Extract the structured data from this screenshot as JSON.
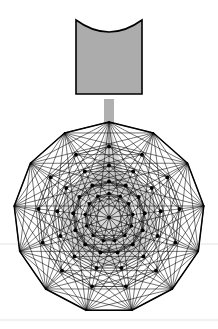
{
  "figure": {
    "background_color": "#ffffff",
    "canvas": {
      "width": 218,
      "height": 329
    }
  },
  "colors": {
    "stroke": "#000000",
    "gray_fill": "#ACACAC",
    "gray_stem": "#B0B0B0",
    "cone_shade": "#B4B4B4",
    "vertex_dot": "#000000",
    "faint_rule": "#EDEDED"
  },
  "cup": {
    "name": "gray cup shape",
    "left": 76,
    "right": 142,
    "top": 20,
    "bottom": 94,
    "concave_top_depth": 12,
    "fill": "#ACACAC",
    "stroke_width": 1.6
  },
  "stem": {
    "name": "connector stem",
    "left": 104,
    "right": 114,
    "top": 99,
    "bottom": 124,
    "fill": "#B0B0B0"
  },
  "cone": {
    "name": "gray cone shading",
    "apex_x": 109,
    "apex_y": 122,
    "base_y": 252,
    "half_width": 36,
    "fill": "#B4B4B4",
    "opacity": 0.55
  },
  "inner_ring_shade": {
    "name": "gray annulus shading",
    "center_x": 109,
    "center_y": 218,
    "outer_radius": 48,
    "inner_radius": 30,
    "fill": "#B4B4B4",
    "opacity": 0.5
  },
  "polygon": {
    "name": "tridecagon",
    "sides": 13,
    "center_x": 109,
    "center_y": 217.5,
    "radius": 95.5,
    "start_angle_deg": -90,
    "stroke_width": 1.5
  },
  "rings": [
    {
      "label": "outer",
      "radius": 95.5,
      "count": 13,
      "dot_radius": 0
    },
    {
      "label": "ring-2",
      "radius": 71.0,
      "count": 13,
      "dot_radius": 2.0
    },
    {
      "label": "ring-3",
      "radius": 52.0,
      "count": 13,
      "dot_radius": 2.0
    },
    {
      "label": "ring-4",
      "radius": 36.0,
      "count": 13,
      "dot_radius": 2.0
    },
    {
      "label": "ring-5",
      "radius": 24.0,
      "count": 13,
      "dot_radius": 1.8
    },
    {
      "label": "center",
      "radius": 0,
      "count": 1,
      "dot_radius": 2.0
    }
  ],
  "chords": {
    "description": "All chords of the 13-gon connecting every vertex to every other vertex",
    "skips": [
      1,
      2,
      3,
      4,
      5,
      6
    ]
  },
  "faint_rules": [
    {
      "name": "upper-faint-rule",
      "y": 244,
      "x1": 0,
      "x2": 218
    },
    {
      "name": "lower-faint-rule",
      "y": 320,
      "x1": 0,
      "x2": 218
    }
  ],
  "labels": {
    "figure_caption": ""
  }
}
